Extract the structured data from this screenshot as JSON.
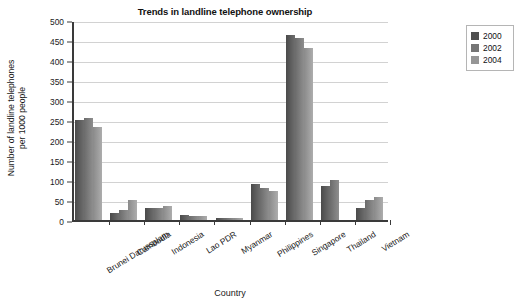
{
  "chart_data": {
    "type": "bar",
    "title": "Trends in landline telephone ownership",
    "xlabel": "Country",
    "ylabel_line1": "Number of landline telephones",
    "ylabel_line2": "per 1000 people",
    "ylim": [
      0,
      500
    ],
    "ytick_step": 50,
    "yticks": [
      500,
      450,
      400,
      350,
      300,
      250,
      200,
      150,
      100,
      50,
      0
    ],
    "grid": true,
    "legend_position": "right-outside",
    "categories": [
      "Brunei Darussalam",
      "Cambodia",
      "Indonesia",
      "Lao PDR",
      "Myanmar",
      "Philippines",
      "Singapore",
      "Thailand",
      "Vietnam"
    ],
    "series": [
      {
        "name": "2000",
        "color": "#4f4f4f",
        "values": [
          250,
          17,
          29,
          13,
          5,
          89,
          462,
          86,
          31
        ]
      },
      {
        "name": "2002",
        "color": "#757575",
        "values": [
          256,
          26,
          31,
          10,
          5,
          81,
          455,
          99,
          51
        ]
      },
      {
        "name": "2004",
        "color": "#969696",
        "values": [
          233,
          51,
          36,
          9,
          4,
          73,
          430,
          0,
          57
        ]
      }
    ]
  }
}
